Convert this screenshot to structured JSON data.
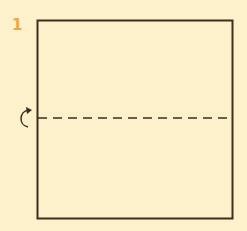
{
  "step": {
    "number": "1"
  },
  "diagram": {
    "type": "origami-fold-instruction",
    "paper": {
      "shape": "square",
      "fill": "#fdf1cc",
      "stroke": "#3a2e1e"
    },
    "fold_line": {
      "style": "dashed",
      "orientation": "horizontal",
      "position": "middle"
    },
    "fold_arrow": {
      "direction": "fold-behind / valley",
      "side": "left"
    },
    "colors": {
      "background": "#fdf1cc",
      "outline": "#3a2e1e",
      "step_number": "#eea64a"
    }
  }
}
